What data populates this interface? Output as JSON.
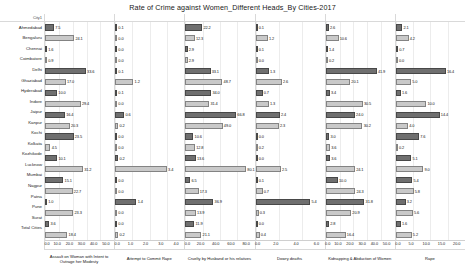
{
  "header": {
    "title": "Rate of Crime against Women_Different Heads_By Cities-2017",
    "city_column_label": "City1"
  },
  "chart_data": {
    "type": "bar",
    "title": "Rate of Crime against Women_Different Heads_By Cities-2017",
    "orientation": "horizontal",
    "grid": true,
    "legend": "none",
    "ylabel": "City1",
    "xlabel": "",
    "categories": [
      "Ahmedabad",
      "Bengaluru",
      "Chennai",
      "Coimbatore",
      "Delhi",
      "Ghaziabad",
      "Hyderabad",
      "Indore",
      "Jaipur",
      "Kanpur",
      "Kochi",
      "Kolkata",
      "Kozhikode",
      "Lucknow",
      "Mumbai",
      "Nagpur",
      "Patna",
      "Pune",
      "Surat",
      "Total Cities"
    ],
    "panels": [
      {
        "title": "Assault on Woman with Intent to Outrage her Modesty",
        "xlim": [
          0,
          50
        ],
        "ticks": [
          "0.0",
          "10.0",
          "20.0",
          "30.0",
          "40.0",
          "50.0"
        ],
        "values": [
          7.5,
          24.1,
          1.6,
          0.9,
          33.6,
          17.0,
          10.0,
          29.4,
          16.4,
          20.3,
          23.5,
          4.5,
          10.1,
          31.2,
          15.1,
          22.7,
          1.0,
          23.3,
          3.6,
          18.4
        ]
      },
      {
        "title": "Attempt to Commit Rape",
        "xlim": [
          0,
          4
        ],
        "ticks": [
          "0.0",
          "1.0",
          "2.0",
          "3.0",
          "4.0"
        ],
        "values": [
          0.1,
          0.0,
          0.0,
          0.0,
          0.1,
          1.2,
          0.1,
          0.0,
          0.6,
          0.2,
          0.0,
          0.0,
          0.2,
          3.4,
          0.0,
          0.0,
          1.4,
          0.0,
          0.0,
          0.2
        ]
      },
      {
        "title": "Cruelty by Husband or his relatives",
        "xlim": [
          0,
          80
        ],
        "ticks": [
          "0.0",
          "20.0",
          "40.0",
          "60.0",
          "80.0"
        ],
        "values": [
          22.2,
          12.3,
          2.9,
          2.9,
          33.1,
          48.7,
          34.0,
          31.4,
          66.8,
          49.0,
          10.6,
          12.8,
          13.6,
          80.1,
          6.5,
          17.3,
          36.9,
          13.9,
          11.9,
          21.1
        ]
      },
      {
        "title": "Dowry deaths",
        "xlim": [
          0,
          6
        ],
        "ticks": [
          "0.0",
          "2.0",
          "4.0",
          "6.0"
        ],
        "values": [
          0.1,
          1.2,
          0.1,
          0.0,
          1.3,
          2.6,
          0.7,
          1.3,
          2.4,
          2.3,
          0.0,
          0.2,
          0.0,
          2.5,
          0.1,
          0.7,
          5.4,
          0.3,
          0.0,
          0.4
        ]
      },
      {
        "title": "Kidnapping & Abduction of Women",
        "xlim": [
          0,
          50
        ],
        "ticks": [
          "0.0",
          "10.0",
          "20.0",
          "30.0",
          "40.0",
          "50.0"
        ],
        "values": [
          2.6,
          10.6,
          1.4,
          0.2,
          41.9,
          20.1,
          3.4,
          30.5,
          24.0,
          30.2,
          3.0,
          3.6,
          3.6,
          24.1,
          10.0,
          24.3,
          31.8,
          20.9,
          2.8,
          16.4
        ]
      },
      {
        "title": "Rape",
        "xlim": [
          0,
          20
        ],
        "ticks": [
          "0.0",
          "5.0",
          "10.0",
          "15.0",
          "20.0"
        ],
        "values": [
          2.1,
          4.2,
          0.7,
          0.0,
          16.4,
          5.0,
          1.6,
          10.0,
          14.4,
          4.0,
          7.6,
          0.2,
          5.1,
          9.0,
          5.4,
          5.8,
          3.2,
          5.6,
          1.6,
          5.2
        ]
      }
    ]
  },
  "colors": {
    "bar_dark": "#6f6f6f",
    "bar_light": "#c9c9c9",
    "grid": "#ececec",
    "text": "#1a1a1a"
  }
}
